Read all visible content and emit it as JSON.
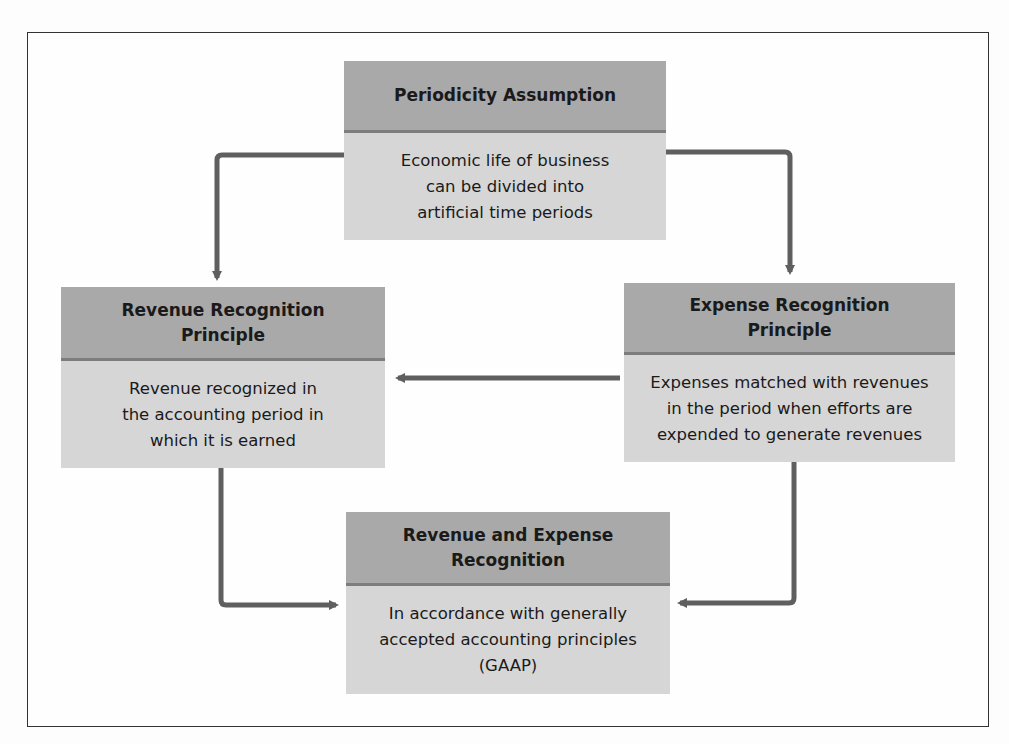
{
  "diagram": {
    "boxes": {
      "periodicity": {
        "title": "Periodicity Assumption",
        "text": "Economic life of business\ncan be divided into\nartificial time periods"
      },
      "revenue": {
        "title": "Revenue Recognition\nPrinciple",
        "text": "Revenue recognized in\nthe accounting period in\nwhich it is earned"
      },
      "expense": {
        "title": "Expense Recognition\nPrinciple",
        "text": "Expenses matched with revenues\nin the period when efforts are\nexpended to generate revenues"
      },
      "combined": {
        "title": "Revenue and Expense\nRecognition",
        "text": "In accordance with generally\naccepted accounting principles\n(GAAP)"
      }
    },
    "connections": [
      {
        "from": "periodicity",
        "to": "revenue"
      },
      {
        "from": "periodicity",
        "to": "expense"
      },
      {
        "from": "expense",
        "to": "revenue"
      },
      {
        "from": "revenue",
        "to": "combined"
      },
      {
        "from": "expense",
        "to": "combined"
      }
    ],
    "colors": {
      "header": "#a9a9a9",
      "header_rule": "#7d7d7d",
      "body": "#d6d6d6",
      "arrow": "#5f5f5f",
      "frame": "#333333"
    }
  }
}
